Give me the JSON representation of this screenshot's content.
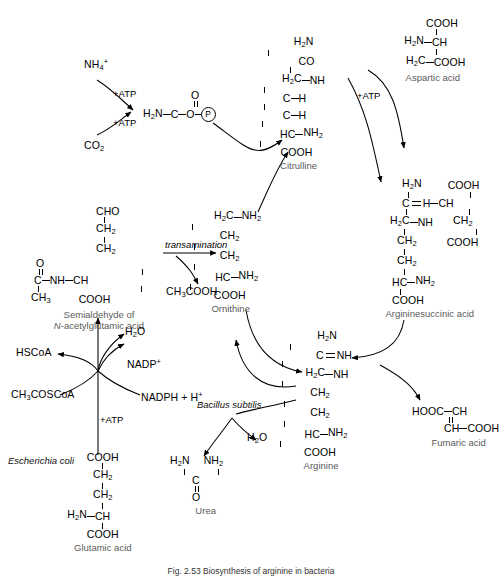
{
  "figure": {
    "caption": "Fig. 2.53 Biosynthesis of arginine in bacteria",
    "width": 502,
    "height": 579,
    "background": "#ffffff",
    "label_color": "#5a5a5a",
    "ink_color": "#000000"
  },
  "compounds": {
    "ammonium": {
      "label": "NH",
      "sub": "4",
      "sup": "+"
    },
    "co2": {
      "label": "CO",
      "sub": "2"
    },
    "carbamoyl_phosphate": {
      "amine": "H",
      "amine_sub": "2",
      "amine_rest": "N",
      "carbonyl_top": "O",
      "carbon": "C",
      "oxygen": "O",
      "phosphate": "P"
    },
    "citrulline": {
      "name": "Citrulline",
      "lines": [
        "H2N",
        "CO",
        "H2C—NH",
        "C—H",
        "C—H",
        "HC—NH2",
        "COOH"
      ],
      "l1_a": "H",
      "l1_sub": "2",
      "l1_b": "N",
      "l2": "CO",
      "l3_a": "H",
      "l3_sub": "2",
      "l3_b": "C",
      "l3_c": "NH",
      "l4_a": "C",
      "l4_b": "H",
      "l5_a": "C",
      "l5_b": "H",
      "l6_a": "HC",
      "l6_b": "NH",
      "l6_sub": "2",
      "l7": "COOH"
    },
    "aspartic_acid": {
      "name": "Aspartic acid",
      "top": "COOH",
      "mid_a": "H",
      "mid_sub": "2",
      "mid_b": "N",
      "mid_c": "CH",
      "bot_a": "H",
      "bot_sub": "2",
      "bot_b": "C",
      "bot_c": "COOH"
    },
    "argininosuccinic_acid": {
      "name": "Argininesuccinic acid",
      "h2n_a": "H",
      "h2n_sub": "2",
      "h2n_b": "N",
      "cooh_top": "COOH",
      "c_eq_h": "C",
      "eq_h": "H",
      "ch": "CH",
      "h2c_a": "H",
      "h2c_sub": "2",
      "h2c_b": "C",
      "nh": "NH",
      "ch2_a": "CH",
      "ch2_sub": "2",
      "cooh_right": "COOH",
      "ch2b_a": "CH",
      "ch2b_sub": "2",
      "hc_a": "HC",
      "hc_b": "NH",
      "hc_sub": "2",
      "cooh_bot": "COOH"
    },
    "ornithine": {
      "name": "Ornithine",
      "l1_a": "H",
      "l1_sub": "2",
      "l1_b": "C",
      "l1_c": "NH",
      "l1_csub": "2",
      "l2_a": "CH",
      "l2_sub": "2",
      "l3_a": "CH",
      "l3_sub": "2",
      "l4_a": "HC",
      "l4_b": "NH",
      "l4_sub": "2",
      "l5": "COOH"
    },
    "semialdehyde": {
      "name_line1": "Semialdehyde of",
      "name_line2_italic": "N",
      "name_line2_rest": "-acetylglutamic acid",
      "cho": "CHO",
      "ch2_a": "CH",
      "ch2_sub": "2",
      "ch2b_a": "CH",
      "ch2b_sub": "2",
      "o": "O",
      "c": "C",
      "nh": "NH",
      "ch": "CH",
      "ch3_a": "CH",
      "ch3_sub": "3",
      "cooh": "COOH"
    },
    "arginine": {
      "name": "Arginine",
      "h2n_a": "H",
      "h2n_sub": "2",
      "h2n_b": "N",
      "c": "C",
      "nh_db": "NH",
      "h2c_a": "H",
      "h2c_sub": "2",
      "h2c_b": "C",
      "nh": "NH",
      "ch2_a": "CH",
      "ch2_sub": "2",
      "ch2b_a": "CH",
      "ch2b_sub": "2",
      "hc_a": "HC",
      "hc_b": "NH",
      "hc_sub": "2",
      "cooh": "COOH"
    },
    "fumaric_acid": {
      "name": "Fumaric acid",
      "left": "HOOC",
      "ch_top": "CH",
      "ch_bot": "CH",
      "right": "COOH"
    },
    "urea": {
      "name": "Urea",
      "left_a": "H",
      "left_sub": "2",
      "left_b": "N",
      "right_a": "NH",
      "right_sub": "2",
      "c": "C",
      "o": "O"
    },
    "glutamic_acid": {
      "name": "Glutamic acid",
      "cooh_top": "COOH",
      "ch2_a": "CH",
      "ch2_sub": "2",
      "ch2b_a": "CH",
      "ch2b_sub": "2",
      "h2n_a": "H",
      "h2n_sub": "2",
      "h2n_b": "N",
      "ch": "CH",
      "cooh_bot": "COOH"
    },
    "acetic_acid": {
      "label_a": "CH",
      "sub": "3",
      "label_b": "COOH"
    }
  },
  "cofactors": {
    "atp_1": "+ATP",
    "atp_2": "+ATP",
    "atp_3": "+ATP",
    "atp_4": "+ATP",
    "water_1": {
      "a": "H",
      "sub": "2",
      "b": "O"
    },
    "water_2": {
      "a": "H",
      "sub": "2",
      "b": "O"
    },
    "nadp_plus": {
      "label": "NADP",
      "sup": "+"
    },
    "nadph": {
      "label": "NADPH + H",
      "sup": "+"
    },
    "hscoa": "HSCoA",
    "acetyl_coa": {
      "a": "CH",
      "sub": "3",
      "b": "COSCoA"
    }
  },
  "annotations": {
    "transamination": "transamination",
    "bacillus_subtilis": "Bacillus subtilis",
    "escherichia_coli": "Escherichia coli"
  }
}
